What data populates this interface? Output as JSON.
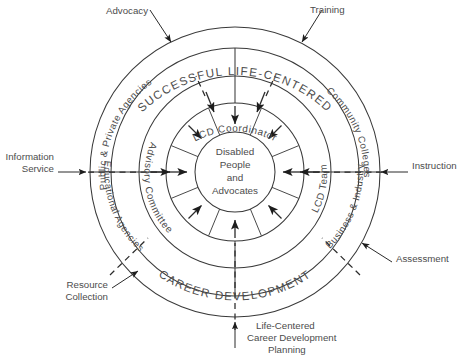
{
  "diagram": {
    "title_band": {
      "top": "SUCCESSFUL LIFE-CENTERED",
      "bottom": "CAREER DEVELOPMENT"
    },
    "center": {
      "line1": "Disabled",
      "line2": "People",
      "line3": "and",
      "line4": "Advocates"
    },
    "ring_inner_actors": {
      "coordinator": "LCD Coordinator",
      "advisory": "Advisory Committee",
      "team": "LCD Team"
    },
    "ring_outer_actors": {
      "public_private": "Public & Private Agencies",
      "community_colleges": "Community Colleges",
      "educational": "Educational Agencies",
      "business_industry": "Business & Industry"
    },
    "external_labels": {
      "advocacy": "Advocacy",
      "training": "Training",
      "information_service_l1": "Information",
      "information_service_l2": "Service",
      "instruction": "Instruction",
      "assessment": "Assessment",
      "resource_l1": "Resource",
      "resource_l2": "Collection",
      "planning_l1": "Life-Centered",
      "planning_l2": "Career Development",
      "planning_l3": "Planning"
    },
    "colors": {
      "stroke": "#3a3a3a",
      "text": "#4c4c4c",
      "background": "#ffffff"
    }
  }
}
